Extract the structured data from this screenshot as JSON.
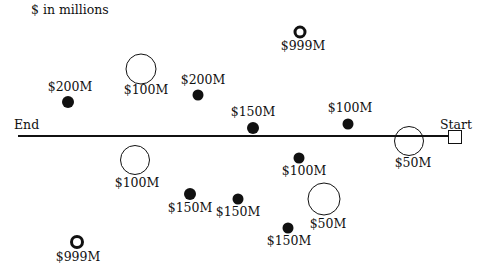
{
  "caption": "$ in millions",
  "axis": {
    "start_label": "Start",
    "end_label": "End"
  },
  "legend_semantics": {
    "solid-dot": "project (small filled marker)",
    "open-circle": "project (large open circle)",
    "thick-ring": "project (small thick ring)"
  },
  "markers": [
    {
      "id": "m1",
      "type": "thick-ring",
      "label": "$999M",
      "x": 300,
      "y": 32,
      "size": 13,
      "lx": 303,
      "ly": 40
    },
    {
      "id": "m2",
      "type": "open-circle",
      "label": "$100M",
      "x": 141,
      "y": 69,
      "size": 31,
      "lx": 146,
      "ly": 84
    },
    {
      "id": "m3",
      "type": "solid-dot",
      "label": "$200M",
      "x": 68,
      "y": 102,
      "size": 12,
      "lx": 70,
      "ly": 81
    },
    {
      "id": "m4",
      "type": "solid-dot",
      "label": "$200M",
      "x": 198,
      "y": 95,
      "size": 11,
      "lx": 203,
      "ly": 74
    },
    {
      "id": "m5",
      "type": "solid-dot",
      "label": "$150M",
      "x": 253,
      "y": 128,
      "size": 12,
      "lx": 253,
      "ly": 106
    },
    {
      "id": "m6",
      "type": "solid-dot",
      "label": "$100M",
      "x": 348,
      "y": 124,
      "size": 11,
      "lx": 350,
      "ly": 102
    },
    {
      "id": "m7",
      "type": "open-circle",
      "label": "$50M",
      "x": 409,
      "y": 141,
      "size": 30,
      "lx": 413,
      "ly": 157
    },
    {
      "id": "m8",
      "type": "open-circle",
      "label": "$100M",
      "x": 135,
      "y": 160,
      "size": 30,
      "lx": 137,
      "ly": 177
    },
    {
      "id": "m9",
      "type": "solid-dot",
      "label": "$100M",
      "x": 299,
      "y": 158,
      "size": 11,
      "lx": 304,
      "ly": 165
    },
    {
      "id": "m10",
      "type": "solid-dot",
      "label": "$150M",
      "x": 190,
      "y": 194,
      "size": 12,
      "lx": 190,
      "ly": 202
    },
    {
      "id": "m11",
      "type": "solid-dot",
      "label": "$150M",
      "x": 238,
      "y": 199,
      "size": 11,
      "lx": 238,
      "ly": 206
    },
    {
      "id": "m12",
      "type": "open-circle",
      "label": "$50M",
      "x": 324,
      "y": 199,
      "size": 33,
      "lx": 328,
      "ly": 218
    },
    {
      "id": "m13",
      "type": "solid-dot",
      "label": "$150M",
      "x": 288,
      "y": 228,
      "size": 11,
      "lx": 289,
      "ly": 235
    },
    {
      "id": "m14",
      "type": "thick-ring",
      "label": "$999M",
      "x": 77,
      "y": 242,
      "size": 14,
      "lx": 78,
      "ly": 251
    }
  ]
}
